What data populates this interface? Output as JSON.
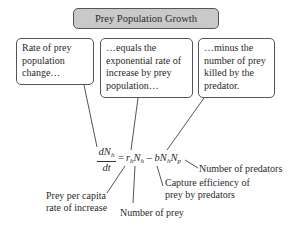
{
  "title": "Prey Population Growth",
  "callouts": [
    {
      "text": "Rate of prey population change…"
    },
    {
      "text": "…equals the exponential rate of increase by prey population…"
    },
    {
      "text": "…minus the number of prey killed by the predator."
    }
  ],
  "equation": {
    "numerator": "dN",
    "numerator_sub": "h",
    "denominator": "dt",
    "equals": "=",
    "r": "r",
    "r_sub": "h",
    "N1": "N",
    "N1_sub": "h",
    "minus": "–",
    "b": "b",
    "N2": "N",
    "N2_sub": "h",
    "N3": "N",
    "N3_sub": "p"
  },
  "labels": {
    "per_capita_line1": "Prey per capita",
    "per_capita_line2": "rate of increase",
    "number_of_prey": "Number of prey",
    "capture_line1": "Capture efficiency of",
    "capture_line2": "prey by predators",
    "number_of_predators": "Number of predators"
  },
  "colors": {
    "title_fill": "#c9c9c9",
    "border": "#555555",
    "line": "#555555"
  }
}
